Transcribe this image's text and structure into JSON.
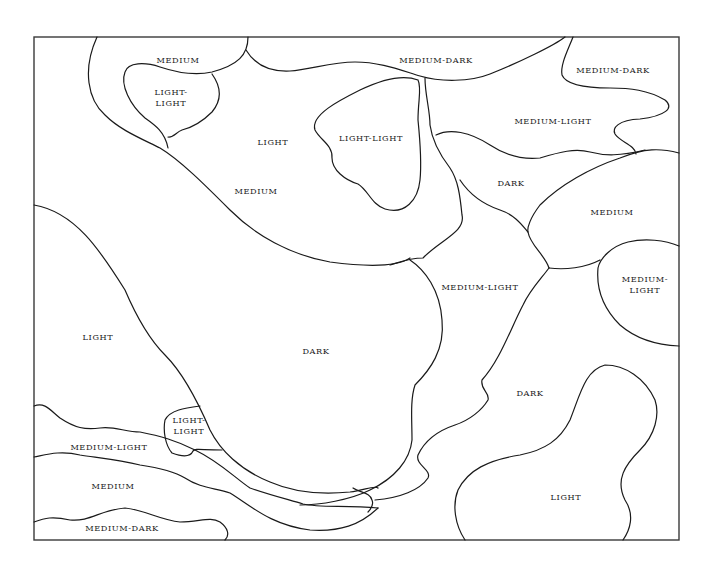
{
  "diagram": {
    "type": "tonal value region map",
    "regions": [
      {
        "id": "r1",
        "label": "MEDIUM",
        "lines": [
          "MEDIUM"
        ],
        "x": 178,
        "y": 60
      },
      {
        "id": "r2",
        "label": "MEDIUM-DARK",
        "lines": [
          "MEDIUM-DARK"
        ],
        "x": 436,
        "y": 60
      },
      {
        "id": "r3",
        "label": "MEDIUM-DARK",
        "lines": [
          "MEDIUM-DARK"
        ],
        "x": 613,
        "y": 70
      },
      {
        "id": "r4",
        "label": "LIGHT-LIGHT",
        "lines": [
          "LIGHT-",
          "LIGHT"
        ],
        "x": 171,
        "y": 97
      },
      {
        "id": "r5",
        "label": "LIGHT",
        "lines": [
          "LIGHT"
        ],
        "x": 273,
        "y": 142
      },
      {
        "id": "r6",
        "label": "LIGHT-LIGHT",
        "lines": [
          "LIGHT-LIGHT"
        ],
        "x": 371,
        "y": 138
      },
      {
        "id": "r7",
        "label": "MEDIUM-LIGHT",
        "lines": [
          "MEDIUM-LIGHT"
        ],
        "x": 553,
        "y": 121
      },
      {
        "id": "r8",
        "label": "MEDIUM",
        "lines": [
          "MEDIUM"
        ],
        "x": 256,
        "y": 191
      },
      {
        "id": "r9",
        "label": "DARK",
        "lines": [
          "DARK"
        ],
        "x": 511,
        "y": 183
      },
      {
        "id": "r10",
        "label": "MEDIUM",
        "lines": [
          "MEDIUM"
        ],
        "x": 612,
        "y": 212
      },
      {
        "id": "r11",
        "label": "MEDIUM-LIGHT",
        "lines": [
          "MEDIUM-LIGHT"
        ],
        "x": 480,
        "y": 287
      },
      {
        "id": "r12",
        "label": "MEDIUM-LIGHT",
        "lines": [
          "MEDIUM-",
          "LIGHT"
        ],
        "x": 645,
        "y": 284
      },
      {
        "id": "r13",
        "label": "LIGHT",
        "lines": [
          "LIGHT"
        ],
        "x": 98,
        "y": 337
      },
      {
        "id": "r14",
        "label": "DARK",
        "lines": [
          "DARK"
        ],
        "x": 316,
        "y": 351
      },
      {
        "id": "r15",
        "label": "DARK",
        "lines": [
          "DARK"
        ],
        "x": 530,
        "y": 393
      },
      {
        "id": "r16",
        "label": "LIGHT-LIGHT",
        "lines": [
          "LIGHT-",
          "LIGHT"
        ],
        "x": 189,
        "y": 425
      },
      {
        "id": "r17",
        "label": "MEDIUM-LIGHT",
        "lines": [
          "MEDIUM-LIGHT"
        ],
        "x": 109,
        "y": 447
      },
      {
        "id": "r18",
        "label": "MEDIUM",
        "lines": [
          "MEDIUM"
        ],
        "x": 113,
        "y": 486
      },
      {
        "id": "r19",
        "label": "LIGHT",
        "lines": [
          "LIGHT"
        ],
        "x": 566,
        "y": 497
      },
      {
        "id": "r20",
        "label": "MEDIUM-DARK",
        "lines": [
          "MEDIUM-DARK"
        ],
        "x": 122,
        "y": 528
      }
    ]
  },
  "colors": {
    "background": "#ffffff",
    "line": "#1a1a1a",
    "frame": "#3a3a3a",
    "text": "#222222"
  }
}
